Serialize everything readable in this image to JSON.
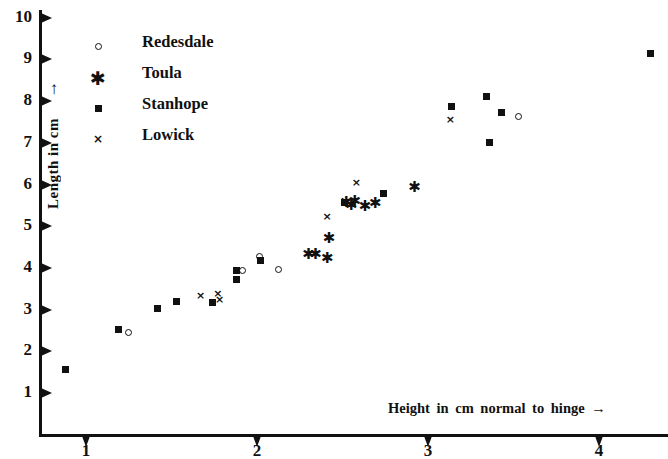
{
  "chart_data": {
    "type": "scatter",
    "title": "",
    "xlabel": "Height in cm normal to hinge",
    "xlabel_arrow": "→",
    "ylabel": "Length in cm",
    "ylabel_arrow": "↑",
    "xlim": [
      0.55,
      4.45
    ],
    "ylim": [
      0.3,
      10.35
    ],
    "xticks": [
      1,
      2,
      3,
      4
    ],
    "xtick_labels": [
      "1",
      "2",
      "3",
      "4"
    ],
    "yticks": [
      1,
      2,
      3,
      4,
      5,
      6,
      7,
      8,
      9,
      10
    ],
    "ytick_labels": [
      "1",
      "2",
      "3",
      "4",
      "5",
      "6",
      "7",
      "8",
      "9",
      "10"
    ],
    "grid": false,
    "legend_position": "upper-left-inside",
    "series": [
      {
        "name": "Redesdale",
        "marker": "circle-open",
        "marker_glyph": "○",
        "color": "#111111",
        "points": [
          [
            1.25,
            2.45
          ],
          [
            1.92,
            3.93
          ],
          [
            2.02,
            4.27
          ],
          [
            2.13,
            3.96
          ],
          [
            3.53,
            7.62
          ]
        ]
      },
      {
        "name": "Toula",
        "marker": "asterisk",
        "marker_glyph": "✱",
        "color": "#111111",
        "points": [
          [
            2.3,
            4.33
          ],
          [
            2.34,
            4.33
          ],
          [
            2.42,
            4.71
          ],
          [
            2.41,
            4.22
          ],
          [
            2.52,
            5.58
          ],
          [
            2.55,
            5.5
          ],
          [
            2.57,
            5.6
          ],
          [
            2.63,
            5.48
          ],
          [
            2.69,
            5.55
          ],
          [
            2.92,
            5.93
          ]
        ]
      },
      {
        "name": "Stanhope",
        "marker": "square-filled",
        "marker_glyph": "■",
        "color": "#111111",
        "points": [
          [
            0.88,
            1.57
          ],
          [
            1.19,
            2.53
          ],
          [
            1.42,
            3.02
          ],
          [
            1.53,
            3.2
          ],
          [
            1.74,
            3.18
          ],
          [
            1.88,
            3.93
          ],
          [
            1.88,
            3.72
          ],
          [
            2.02,
            4.18
          ],
          [
            2.51,
            5.58
          ],
          [
            2.74,
            5.79
          ],
          [
            3.14,
            7.88
          ],
          [
            3.34,
            8.12
          ],
          [
            3.36,
            7.0
          ],
          [
            3.43,
            7.72
          ],
          [
            4.3,
            9.15
          ]
        ]
      },
      {
        "name": "Lowick",
        "marker": "x-cross",
        "marker_glyph": "×",
        "color": "#111111",
        "points": [
          [
            1.67,
            3.34
          ],
          [
            1.77,
            3.38
          ],
          [
            1.78,
            3.24
          ],
          [
            2.41,
            5.23
          ],
          [
            2.58,
            6.05
          ],
          [
            3.13,
            7.55
          ]
        ]
      }
    ]
  },
  "legend": {
    "entries": [
      {
        "label": "Redesdale",
        "icon": "circle-open-icon"
      },
      {
        "label": "Toula",
        "icon": "asterisk-icon"
      },
      {
        "label": "Stanhope",
        "icon": "square-filled-icon"
      },
      {
        "label": "Lowick",
        "icon": "x-cross-icon"
      }
    ]
  }
}
